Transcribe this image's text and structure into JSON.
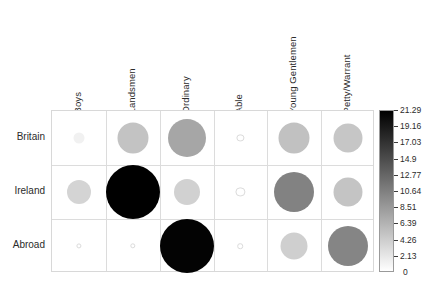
{
  "chart_data": {
    "type": "heatmap",
    "subtype": "balloon-plot",
    "title": "",
    "xlabel": "",
    "ylabel": "",
    "categories": [
      "Boys",
      "Landsmen",
      "Ordinary",
      "Able",
      "Young Gentlemen",
      "Petty/Warrant"
    ],
    "rows": [
      "Britain",
      "Ireland",
      "Abroad"
    ],
    "grid": true,
    "legend_position": "right",
    "value_range": [
      0,
      21.29
    ],
    "colormap": "grayscale-inverted",
    "colorbar": {
      "ticks": [
        "21.29",
        "19.16",
        "17.03",
        "14.9",
        "12.77",
        "10.64",
        "8.51",
        "6.39",
        "4.26",
        "2.13",
        "0"
      ],
      "tick_values": [
        21.29,
        19.16,
        17.03,
        14.9,
        12.77,
        10.64,
        8.51,
        6.39,
        4.26,
        2.13,
        0
      ],
      "min": 0,
      "max": 21.29
    },
    "series": [
      {
        "name": "Britain",
        "values": [
          1.2,
          5.0,
          7.4,
          0.6,
          5.2,
          4.8
        ]
      },
      {
        "name": "Ireland",
        "values": [
          3.6,
          21.29,
          3.8,
          1.0,
          10.4,
          4.9
        ]
      },
      {
        "name": "Abroad",
        "values": [
          0.5,
          0.5,
          21.0,
          0.5,
          4.0,
          10.2
        ]
      }
    ],
    "cells": [
      {
        "row": "Britain",
        "col": "Boys",
        "value": 1.2,
        "radius": 5.5
      },
      {
        "row": "Britain",
        "col": "Landsmen",
        "value": 5.0,
        "radius": 15.5
      },
      {
        "row": "Britain",
        "col": "Ordinary",
        "value": 7.4,
        "radius": 19.0
      },
      {
        "row": "Britain",
        "col": "Able",
        "value": 0.6,
        "radius": 2.6
      },
      {
        "row": "Britain",
        "col": "Young Gentlemen",
        "value": 5.2,
        "radius": 15.5
      },
      {
        "row": "Britain",
        "col": "Petty/Warrant",
        "value": 4.8,
        "radius": 14.5
      },
      {
        "row": "Ireland",
        "col": "Boys",
        "value": 3.6,
        "radius": 12.0
      },
      {
        "row": "Ireland",
        "col": "Landsmen",
        "value": 21.29,
        "radius": 27.0
      },
      {
        "row": "Ireland",
        "col": "Ordinary",
        "value": 3.8,
        "radius": 13.0
      },
      {
        "row": "Ireland",
        "col": "Able",
        "value": 1.0,
        "radius": 3.6
      },
      {
        "row": "Ireland",
        "col": "Young Gentlemen",
        "value": 10.4,
        "radius": 20.0
      },
      {
        "row": "Ireland",
        "col": "Petty/Warrant",
        "value": 4.9,
        "radius": 14.5
      },
      {
        "row": "Abroad",
        "col": "Boys",
        "value": 0.5,
        "radius": 1.6
      },
      {
        "row": "Abroad",
        "col": "Landsmen",
        "value": 0.5,
        "radius": 1.7
      },
      {
        "row": "Abroad",
        "col": "Ordinary",
        "value": 21.0,
        "radius": 27.0
      },
      {
        "row": "Abroad",
        "col": "Able",
        "value": 0.5,
        "radius": 1.8
      },
      {
        "row": "Abroad",
        "col": "Young Gentlemen",
        "value": 4.0,
        "radius": 13.5
      },
      {
        "row": "Abroad",
        "col": "Petty/Warrant",
        "value": 10.2,
        "radius": 20.0
      }
    ]
  },
  "axes": {
    "columns": [
      {
        "label": "Boys"
      },
      {
        "label": "Landsmen"
      },
      {
        "label": "Ordinary"
      },
      {
        "label": "Able"
      },
      {
        "label": "Young Gentlemen"
      },
      {
        "label": "Petty/Warrant"
      }
    ],
    "rows": [
      {
        "label": "Britain"
      },
      {
        "label": "Ireland"
      },
      {
        "label": "Abroad"
      }
    ]
  },
  "colorbar_labels": [
    {
      "text": "21.29"
    },
    {
      "text": "19.16"
    },
    {
      "text": "17.03"
    },
    {
      "text": "14.9"
    },
    {
      "text": "12.77"
    },
    {
      "text": "10.64"
    },
    {
      "text": "8.51"
    },
    {
      "text": "6.39"
    },
    {
      "text": "4.26"
    },
    {
      "text": "2.13"
    },
    {
      "text": "0"
    }
  ],
  "colors": {
    "grid_line": "#dcdcdc",
    "panel_border": "#d8d8d8",
    "colorbar_high": "#000000",
    "colorbar_low": "#ffffff",
    "text": "#2b2b2b"
  }
}
